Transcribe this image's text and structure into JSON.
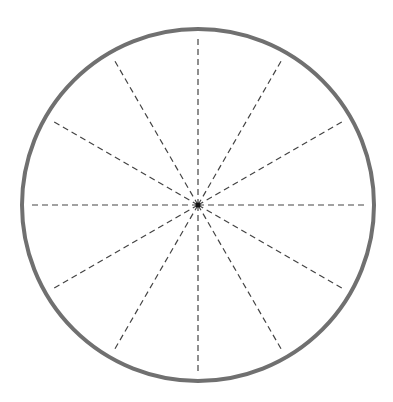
{
  "diagram": {
    "type": "circle-divided-into-sectors",
    "center": {
      "x": 198,
      "y": 205
    },
    "radius": 176,
    "radius_line_length": 168,
    "divisions": 12,
    "angle_step_deg": 30,
    "outline_color": "#707070",
    "outline_width": 4,
    "radius_line_color": "#444444",
    "radius_line_dash": "6 4",
    "center_dot_color": "#111111",
    "center_dot_radius": 2.5
  }
}
